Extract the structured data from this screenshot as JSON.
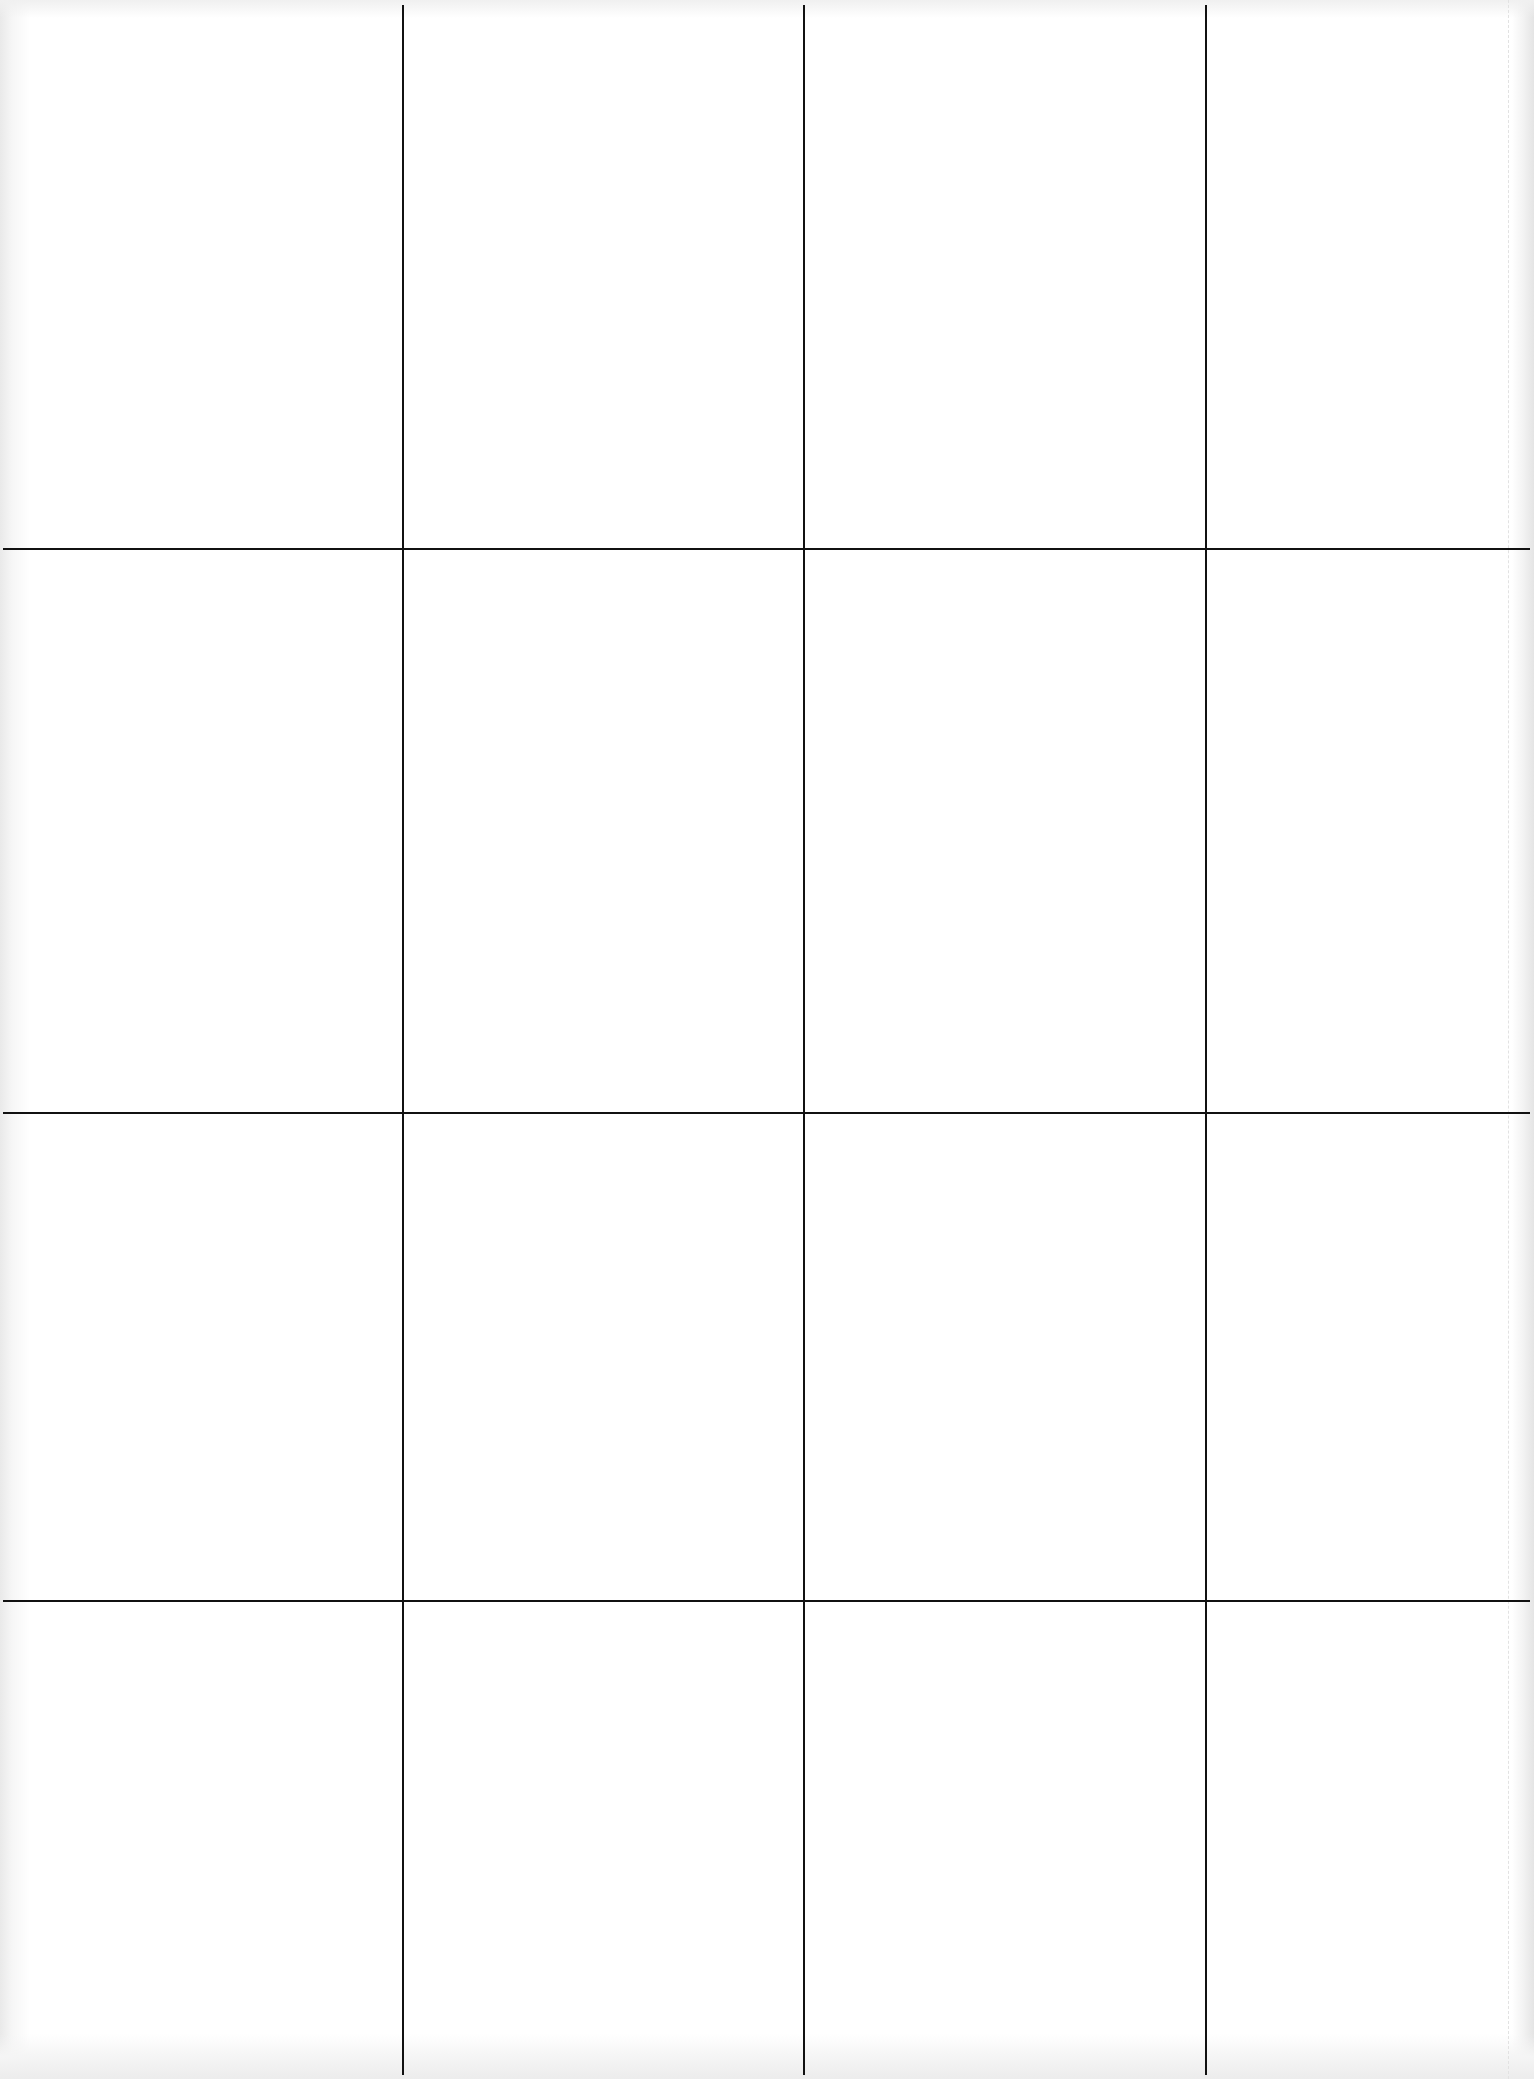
{
  "page": {
    "background": "#ffffff",
    "line_color": "#111111"
  },
  "grid": {
    "columns": 4,
    "rows": 4,
    "vertical_lines_x": [
      403,
      804,
      1206
    ],
    "horizontal_lines_y": [
      549,
      1113,
      1601
    ],
    "line_extent": {
      "left": 3,
      "right": 1530,
      "top": 5,
      "bottom": 2075
    }
  }
}
